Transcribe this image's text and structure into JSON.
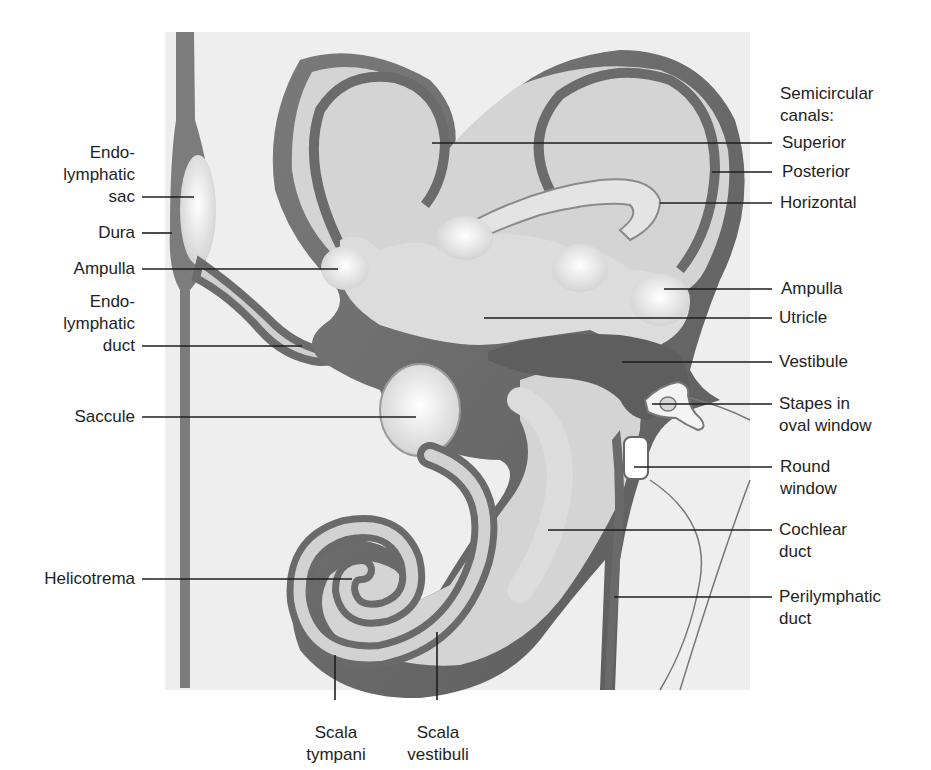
{
  "diagram": {
    "colors": {
      "background": "#ffffff",
      "bone_texture": "#ececec",
      "perilymph_dark": "#6e6e6e",
      "membranous_light": "#d6d6d6",
      "highlight": "#f7f7f7",
      "leader_line": "#1e1e1e",
      "text": "#1e1e1e"
    },
    "left_labels": [
      {
        "id": "endolymphatic-sac",
        "lines": [
          "Endo-",
          "lymphatic",
          "sac"
        ]
      },
      {
        "id": "dura",
        "lines": [
          "Dura"
        ]
      },
      {
        "id": "ampulla-left",
        "lines": [
          "Ampulla"
        ]
      },
      {
        "id": "endolymphatic-duct",
        "lines": [
          "Endo-",
          "lymphatic",
          "duct"
        ]
      },
      {
        "id": "saccule",
        "lines": [
          "Saccule"
        ]
      },
      {
        "id": "helicotrema",
        "lines": [
          "Helicotrema"
        ]
      }
    ],
    "right_labels": [
      {
        "id": "semicircular-canals-heading",
        "lines": [
          "Semicircular",
          "canals:"
        ]
      },
      {
        "id": "superior",
        "lines": [
          "Superior"
        ]
      },
      {
        "id": "posterior",
        "lines": [
          "Posterior"
        ]
      },
      {
        "id": "horizontal",
        "lines": [
          "Horizontal"
        ]
      },
      {
        "id": "ampulla-right",
        "lines": [
          "Ampulla"
        ]
      },
      {
        "id": "utricle",
        "lines": [
          "Utricle"
        ]
      },
      {
        "id": "vestibule",
        "lines": [
          "Vestibule"
        ]
      },
      {
        "id": "stapes",
        "lines": [
          "Stapes in",
          "oval window"
        ]
      },
      {
        "id": "round-window",
        "lines": [
          "Round",
          "window"
        ]
      },
      {
        "id": "cochlear-duct",
        "lines": [
          "Cochlear",
          "duct"
        ]
      },
      {
        "id": "perilymphatic-duct",
        "lines": [
          "Perilymphatic",
          "duct"
        ]
      }
    ],
    "bottom_labels": [
      {
        "id": "scala-tympani",
        "lines": [
          "Scala",
          "tympani"
        ]
      },
      {
        "id": "scala-vestibuli",
        "lines": [
          "Scala",
          "vestibuli"
        ]
      }
    ]
  }
}
